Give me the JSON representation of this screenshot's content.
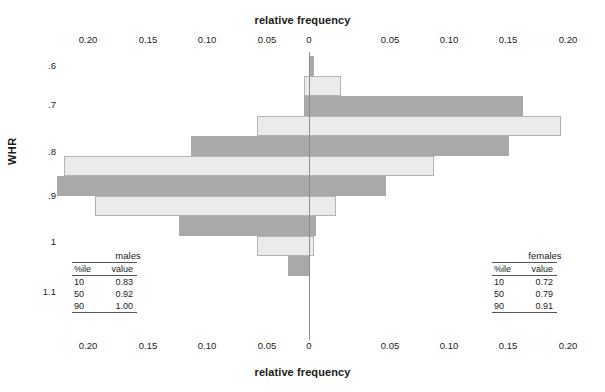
{
  "axes": {
    "top_title": "relative frequency",
    "bottom_title": "relative frequency",
    "y_title": "WHR",
    "x_ticklabels": [
      "0.20",
      "0.15",
      "0.10",
      "0.05",
      "0",
      "0.05",
      "0.10",
      "0.15",
      "0.20"
    ],
    "y_ticklabels": [
      ".6",
      ".7",
      ".8",
      ".9",
      "1",
      "1.1"
    ]
  },
  "tables": {
    "males": {
      "caption": "males",
      "headers": [
        "%ile",
        "value"
      ],
      "rows": [
        [
          "10",
          "0.83"
        ],
        [
          "50",
          "0.92"
        ],
        [
          "90",
          "1.00"
        ]
      ]
    },
    "females": {
      "caption": "females",
      "headers": [
        "%ile",
        "value"
      ],
      "rows": [
        [
          "10",
          "0.72"
        ],
        [
          "50",
          "0.79"
        ],
        [
          "90",
          "0.91"
        ]
      ]
    }
  },
  "colors": {
    "males_fill": "#ebebeb",
    "males_border": "#b4b4b4",
    "females_fill": "#a9a9a9",
    "axis": "#8c8c8c",
    "text": "#1a1a1a"
  },
  "chart_data": {
    "type": "bar",
    "subtype": "back-to-back population pyramid (paired histograms)",
    "title": "",
    "xlabel": "relative frequency",
    "ylabel": "WHR",
    "orientation": "horizontal",
    "xlim": [
      -0.22,
      0.22
    ],
    "x_tick_values": [
      -0.2,
      -0.15,
      -0.1,
      -0.05,
      0,
      0.05,
      0.1,
      0.15,
      0.2
    ],
    "x_tick_labels": [
      "0.20",
      "0.15",
      "0.10",
      "0.05",
      "0",
      "0.05",
      "0.10",
      "0.15",
      "0.20"
    ],
    "ylim": [
      0.58,
      1.14
    ],
    "y_tick_values": [
      0.6,
      0.7,
      0.8,
      0.9,
      1.0,
      1.1
    ],
    "y_tick_labels": [
      ".6",
      ".7",
      ".8",
      ".9",
      "1",
      "1.1"
    ],
    "grid": false,
    "legend": "none",
    "note": "Left half (light bars) = males relative frequency plotted toward the left; right half (dark bars) = females relative frequency plotted toward the right. Each drawn rectangle spans from -males to +females for its WHR bin.",
    "bin_width": 0.0275,
    "categories": [
      "0.60",
      "0.63",
      "0.66",
      "0.69",
      "0.72",
      "0.74",
      "0.77",
      "0.80",
      "0.83",
      "0.86",
      "0.89",
      "0.92",
      "0.94",
      "0.97"
    ],
    "series": [
      {
        "name": "males",
        "color": "#ebebeb",
        "direction": "left",
        "values": [
          0.0,
          0.0,
          0.0,
          0.004,
          0.0,
          0.044,
          0.0,
          0.099,
          0.0,
          0.206,
          0.0,
          0.109,
          0.0,
          0.018
        ]
      },
      {
        "name": "females",
        "color": "#a9a9a9",
        "direction": "right",
        "values": [
          0.004,
          0.0,
          0.027,
          0.0,
          0.18,
          0.0,
          0.212,
          0.0,
          0.168,
          0.0,
          0.105,
          0.0,
          0.023,
          0.0
        ]
      }
    ],
    "bars": [
      {
        "whr_bin": "0.60",
        "group": "females",
        "left": 0.0,
        "right": 0.004
      },
      {
        "whr_bin": "0.63",
        "group": "males",
        "left": -0.004,
        "right": 0.027
      },
      {
        "whr_bin": "0.66",
        "group": "females",
        "left": -0.004,
        "right": 0.18
      },
      {
        "whr_bin": "0.69",
        "group": "males",
        "left": -0.044,
        "right": 0.212
      },
      {
        "whr_bin": "0.72",
        "group": "females",
        "left": -0.099,
        "right": 0.168
      },
      {
        "whr_bin": "0.74",
        "group": "males",
        "left": -0.206,
        "right": 0.105
      },
      {
        "whr_bin": "0.77",
        "group": "females",
        "left": -0.212,
        "right": 0.065
      },
      {
        "whr_bin": "0.80",
        "group": "males",
        "left": -0.18,
        "right": 0.023
      },
      {
        "whr_bin": "0.83",
        "group": "females",
        "left": -0.109,
        "right": 0.006
      },
      {
        "whr_bin": "0.86",
        "group": "males",
        "left": -0.044,
        "right": 0.004
      },
      {
        "whr_bin": "0.89",
        "group": "females",
        "left": -0.018,
        "right": 0.0
      }
    ]
  },
  "layout": {
    "zero_x_px": 309,
    "px_per_unit": 1190,
    "plot_top_px": 52,
    "bar_height_px": 20,
    "rows": [
      {
        "y": 4,
        "group": "females",
        "left": 0.0,
        "right": 0.004
      },
      {
        "y": 24,
        "group": "males",
        "left": -0.004,
        "right": 0.027
      },
      {
        "y": 44,
        "group": "females",
        "left": -0.004,
        "right": 0.18
      },
      {
        "y": 64,
        "group": "males",
        "left": -0.044,
        "right": 0.212
      },
      {
        "y": 84,
        "group": "females",
        "left": -0.099,
        "right": 0.168
      },
      {
        "y": 104,
        "group": "males",
        "left": -0.206,
        "right": 0.105
      },
      {
        "y": 124,
        "group": "females",
        "left": -0.212,
        "right": 0.065
      },
      {
        "y": 144,
        "group": "males",
        "left": -0.18,
        "right": 0.023
      },
      {
        "y": 164,
        "group": "females",
        "left": -0.109,
        "right": 0.006
      },
      {
        "y": 184,
        "group": "males",
        "left": -0.044,
        "right": 0.004
      },
      {
        "y": 204,
        "group": "females",
        "left": -0.018,
        "right": 0.0
      }
    ],
    "y_tick_px": [
      66,
      105,
      152,
      196,
      242,
      292
    ],
    "x_tick_px": [
      88,
      148,
      207,
      267,
      309,
      390,
      449,
      508,
      568
    ]
  }
}
